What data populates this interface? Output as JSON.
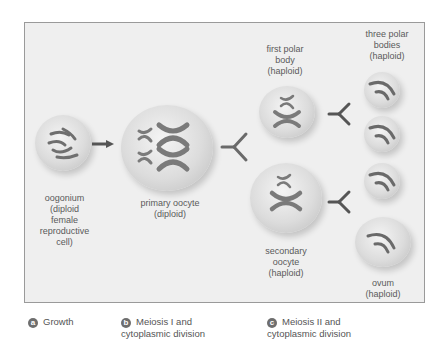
{
  "panels": {
    "a": {
      "label": "oogonium\n(diploid\nfemale\nreproductive\ncell)",
      "label_lines": [
        "oogonium",
        "(diploid",
        "female",
        "reproductive",
        "cell)"
      ]
    },
    "b": {
      "label_lines": [
        "primary oocyte",
        "(diploid)"
      ]
    },
    "c": {
      "first_polar_body_lines": [
        "first polar",
        "body",
        "(haploid)"
      ],
      "three_polar_bodies_lines": [
        "three polar",
        "bodies",
        "(haploid)"
      ],
      "secondary_oocyte_lines": [
        "secondary",
        "oocyte",
        "(haploid)"
      ],
      "ovum_lines": [
        "ovum",
        "(haploid)"
      ]
    }
  },
  "captions": [
    {
      "badge": "a",
      "line1": "Growth",
      "line2": ""
    },
    {
      "badge": "b",
      "line1": "Meiosis I and",
      "line2": "cytoplasmic division"
    },
    {
      "badge": "c",
      "line1": "Meiosis II and",
      "line2": "cytoplasmic division"
    }
  ],
  "colors": {
    "panel_bg": "#efefef",
    "border": "#9a9a9a",
    "chromosome": "#7a7a7a",
    "badge": "#6e6e6e"
  }
}
